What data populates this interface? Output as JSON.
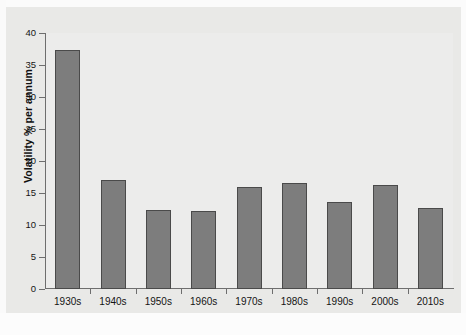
{
  "chart_data": {
    "type": "bar",
    "title": "",
    "xlabel": "",
    "ylabel": "Volatility % per annum",
    "categories": [
      "1930s",
      "1940s",
      "1950s",
      "1960s",
      "1970s",
      "1980s",
      "1990s",
      "2000s",
      "2010s"
    ],
    "values": [
      37.3,
      17.0,
      12.3,
      12.2,
      16.0,
      16.5,
      13.6,
      16.3,
      12.6
    ],
    "ylim": [
      0,
      40
    ],
    "yticks": [
      0,
      5,
      10,
      15,
      20,
      25,
      30,
      35,
      40
    ],
    "ytick_labels": [
      "0",
      "5",
      "10",
      "15",
      "20",
      "25",
      "30",
      "35",
      "40"
    ],
    "grid": false,
    "legend": false,
    "bar_color": "#7d7d7d",
    "bar_edge_color": "#4a4a4a",
    "panel_color": "#ececeb",
    "axis_color": "#6e6e6e"
  }
}
